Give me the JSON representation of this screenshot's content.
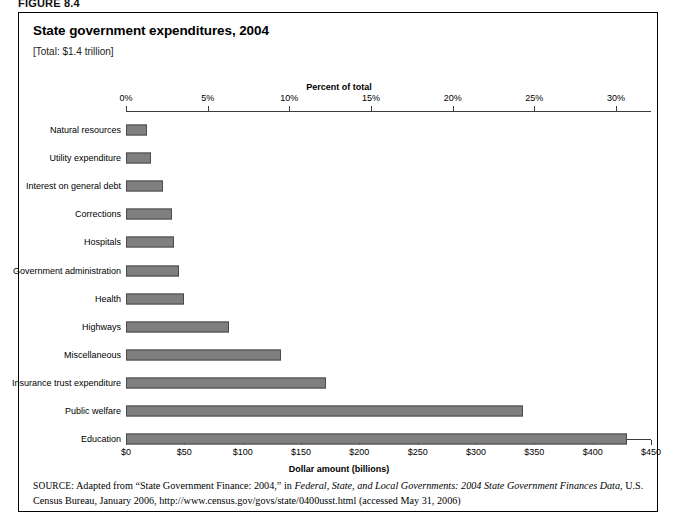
{
  "figure": {
    "label": "FIGURE 8.4",
    "title": "State government expenditures, 2004",
    "subtitle": "[Total: $1.4 trillion]"
  },
  "source": {
    "kicker": "SOURCE:",
    "part1": " Adapted from “State Government Finance: 2004,” in ",
    "italic1": "Federal, State, and Local Governments: 2004 State Government Finances Data",
    "part2": ", U.S. Census Bureau, January 2006, http://www.census.gov/govs/state/0400usst.html (accessed May 31, 2006)"
  },
  "colors": {
    "bar_fill": "#7f7f7f",
    "bar_stroke": "#4a4a4a",
    "axis": "#3a3a3a",
    "frame": "#000000",
    "text": "#000000"
  },
  "chart_data": {
    "type": "bar",
    "orientation": "horizontal",
    "title": "State government expenditures, 2004",
    "subtitle": "[Total: $1.4 trillion]",
    "top_axis_title": "Percent of total",
    "bottom_axis_title": "Dollar amount (billions)",
    "xlabel": "Dollar amount (billions)",
    "ylabel": "",
    "grid": false,
    "legend": false,
    "xlim": [
      0,
      450
    ],
    "xticks": [
      0,
      50,
      100,
      150,
      200,
      250,
      300,
      350,
      400,
      450
    ],
    "xtick_labels": [
      "$0",
      "$50",
      "$100",
      "$150",
      "$200",
      "$250",
      "$300",
      "$350",
      "$400",
      "$450"
    ],
    "top_xlim_percent": [
      0,
      32.14
    ],
    "top_xticks_percent": [
      0,
      5,
      10,
      15,
      20,
      25,
      30
    ],
    "top_xtick_labels": [
      "0%",
      "5%",
      "10%",
      "15%",
      "20%",
      "25%",
      "30%"
    ],
    "categories": [
      "Natural resources",
      "Utility expenditure",
      "Interest on general debt",
      "Corrections",
      "Hospitals",
      "Government administration",
      "Health",
      "Highways",
      "Miscellaneous",
      "Insurance trust expenditure",
      "Public welfare",
      "Education"
    ],
    "values": [
      18,
      21,
      32,
      39,
      41,
      45,
      50,
      88,
      133,
      171,
      340,
      429
    ],
    "percent_values": [
      1.3,
      1.5,
      2.3,
      2.8,
      2.9,
      3.2,
      3.6,
      6.3,
      9.5,
      12.2,
      24.3,
      30.6
    ],
    "value_unit": "billions of dollars"
  }
}
